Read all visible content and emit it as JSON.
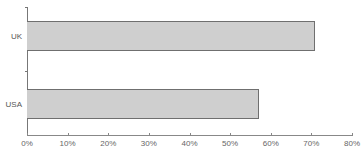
{
  "chart_data": {
    "type": "bar",
    "orientation": "horizontal",
    "title": "",
    "xlabel": "",
    "ylabel": "",
    "categories": [
      "UK",
      "USA"
    ],
    "values": [
      71,
      57
    ],
    "unit": "%",
    "xlim": [
      0,
      80
    ],
    "x_ticks": [
      "0%",
      "10%",
      "20%",
      "30%",
      "40%",
      "50%",
      "60%",
      "70%",
      "80%"
    ],
    "grid": false,
    "legend": null,
    "bar_color": "#cfcfcf",
    "bar_border_color": "#6f6f6f"
  }
}
